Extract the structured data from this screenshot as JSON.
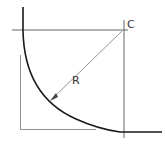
{
  "diagram": {
    "labels": {
      "center": "C",
      "radius": "R"
    },
    "colors": {
      "curve": "#1a1a1a",
      "construction": "#555555",
      "background": "#ffffff"
    }
  }
}
